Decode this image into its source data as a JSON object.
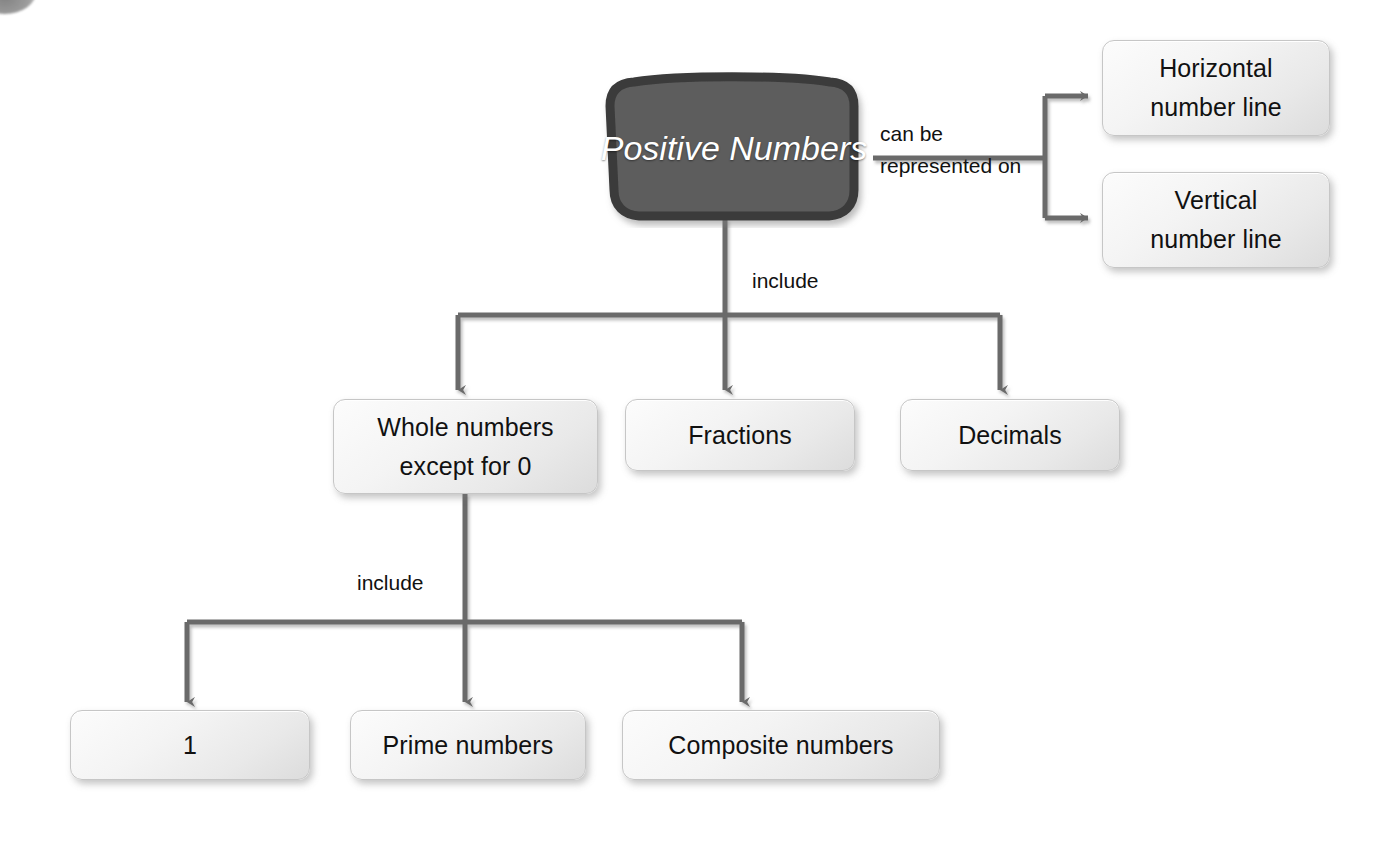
{
  "diagram": {
    "colors": {
      "background": "#ffffff",
      "central_node_fill": "#5a5a5a",
      "central_node_border": "#3a3a3a",
      "central_node_text": "#ffffff",
      "node_fill": "#f0f0f0",
      "node_border": "#c6c6c6",
      "node_text": "#111111",
      "connector": "#6b6b6b",
      "label_text": "#111111"
    },
    "central_node": {
      "name": "positive-numbers",
      "line1": "Positive",
      "line2": "Numbers"
    },
    "edge_labels": {
      "can_be_represented_on": [
        "can be",
        "represented",
        "on"
      ],
      "include_top": "include",
      "include_bottom": "include"
    },
    "representation_nodes": [
      {
        "name": "horizontal-number-line",
        "line1": "Horizontal",
        "line2": "number line"
      },
      {
        "name": "vertical-number-line",
        "line1": "Vertical",
        "line2": "number line"
      }
    ],
    "include_nodes": [
      {
        "name": "whole-numbers-except-zero",
        "line1": "Whole numbers",
        "line2": "except for 0"
      },
      {
        "name": "fractions",
        "line1": "Fractions",
        "line2": ""
      },
      {
        "name": "decimals",
        "line1": "Decimals",
        "line2": ""
      }
    ],
    "whole_number_children": [
      {
        "name": "one",
        "line1": "1",
        "line2": ""
      },
      {
        "name": "prime-numbers",
        "line1": "Prime numbers",
        "line2": ""
      },
      {
        "name": "composite-numbers",
        "line1": "Composite numbers",
        "line2": ""
      }
    ]
  }
}
